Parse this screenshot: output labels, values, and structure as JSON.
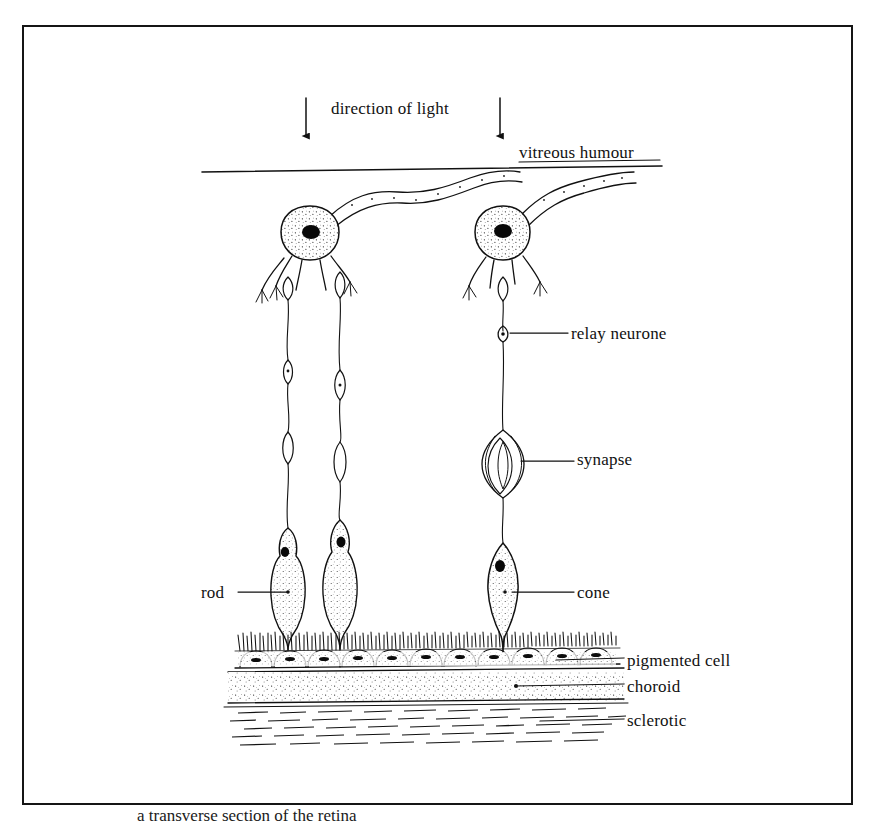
{
  "figure": {
    "domain": "Diagram",
    "background_color": "#ffffff",
    "ink_color": "#111111",
    "frame": {
      "name": "figure-border",
      "color": "#151515",
      "x": 22,
      "y": 25,
      "width": 831,
      "height": 780
    }
  },
  "labels": {
    "direction_of_light": "direction of light",
    "vitreous_humour": "vitreous humour",
    "relay_neurone": "relay neurone",
    "synapse": "synapse",
    "rod": "rod",
    "cone": "cone",
    "pigmented_cell": "pigmented cell",
    "choroid": "choroid",
    "sclerotic": "sclerotic"
  },
  "caption": {
    "text": "a transverse section of the retina",
    "visible": "partially-cropped-at-bottom-edge"
  },
  "arrows": [
    {
      "name": "light-arrow-left",
      "x": 306,
      "y_top": 98,
      "y_bottom": 143
    },
    {
      "name": "light-arrow-right",
      "x": 500,
      "y_top": 98,
      "y_bottom": 143
    }
  ],
  "layers": [
    {
      "name": "vitreous-humour-boundary",
      "type": "line",
      "y": 168
    },
    {
      "name": "rod-and-cone-layer",
      "type": "cells"
    },
    {
      "name": "pigmented-cell-layer",
      "type": "epithelium",
      "y": 648
    },
    {
      "name": "choroid-layer",
      "type": "stippled-band",
      "y_top": 668,
      "y_bottom": 700
    },
    {
      "name": "sclerotic-layer",
      "type": "fibrous-band",
      "y_top": 703,
      "y_bottom": 748
    }
  ],
  "cells": {
    "relay_neurones": [
      {
        "name": "relay-neurone-left",
        "soma_x": 310,
        "soma_y": 233
      },
      {
        "name": "relay-neurone-right",
        "soma_x": 503,
        "soma_y": 233
      }
    ],
    "rods": [
      {
        "name": "rod-left",
        "x": 288,
        "y": 585
      },
      {
        "name": "rod-right",
        "x": 340,
        "y": 578
      }
    ],
    "cones": [
      {
        "name": "cone-single",
        "x": 503,
        "y": 583
      }
    ],
    "synapses": [
      {
        "name": "synapse-marker",
        "x": 503,
        "y": 460
      }
    ]
  },
  "leader_lines": [
    {
      "name": "leader-relay-neurone",
      "from_x": 510,
      "from_y": 333,
      "to_x": 568,
      "to_y": 333
    },
    {
      "name": "leader-synapse",
      "from_x": 520,
      "from_y": 461,
      "to_x": 574,
      "to_y": 461
    },
    {
      "name": "leader-rod",
      "from_x": 238,
      "from_y": 592,
      "to_x": 288,
      "to_y": 592
    },
    {
      "name": "leader-cone",
      "from_x": 512,
      "from_y": 592,
      "to_x": 574,
      "to_y": 592
    },
    {
      "name": "leader-pigmented-cell",
      "from_x": 556,
      "from_y": 659,
      "to_x": 624,
      "to_y": 659
    },
    {
      "name": "leader-choroid",
      "from_x": 520,
      "from_y": 685,
      "to_x": 624,
      "to_y": 685
    },
    {
      "name": "leader-sclerotic",
      "from_x": 545,
      "from_y": 720,
      "to_x": 624,
      "to_y": 720
    }
  ]
}
